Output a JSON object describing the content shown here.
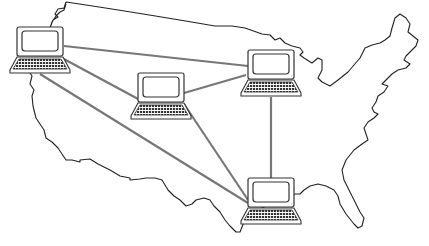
{
  "diagram": {
    "type": "network-map",
    "background": "US map outline",
    "colors": {
      "outline": "#222222",
      "link": "#777777",
      "device": "#333333",
      "background": "#ffffff"
    },
    "nodes": [
      {
        "id": "west",
        "icon": "laptop-icon",
        "x": 40,
        "y": 50
      },
      {
        "id": "center",
        "icon": "laptop-icon",
        "x": 161,
        "y": 96
      },
      {
        "id": "lakes",
        "icon": "laptop-icon",
        "x": 271,
        "y": 73
      },
      {
        "id": "south",
        "icon": "laptop-icon",
        "x": 271,
        "y": 201
      }
    ],
    "links": [
      {
        "from": "west",
        "to": "lakes"
      },
      {
        "from": "west",
        "to": "center"
      },
      {
        "from": "west",
        "to": "south"
      },
      {
        "from": "center",
        "to": "lakes"
      },
      {
        "from": "center",
        "to": "south"
      },
      {
        "from": "lakes",
        "to": "south"
      }
    ]
  }
}
